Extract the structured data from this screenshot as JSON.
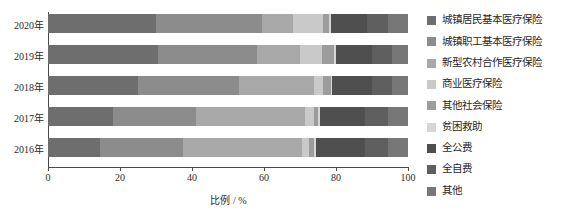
{
  "chart_data": {
    "type": "bar",
    "orientation": "horizontal",
    "stacked": true,
    "title": "",
    "xlabel": "比例 / %",
    "ylabel": "",
    "xlim": [
      0,
      100
    ],
    "xticks": [
      0,
      20,
      40,
      60,
      80,
      100
    ],
    "xtick_labels": [
      "0",
      "20",
      "40",
      "60",
      "80",
      "100"
    ],
    "grid": false,
    "legend_position": "right",
    "categories": [
      "2020年",
      "2019年",
      "2018年",
      "2017年",
      "2016年"
    ],
    "series": [
      {
        "name": "城镇居民基本医疗保险",
        "color": "#6e6e6e",
        "values": [
          30.0,
          30.5,
          25.0,
          18.0,
          14.5
        ]
      },
      {
        "name": "城镇职工基本医疗保险",
        "color": "#8c8c8c",
        "values": [
          29.5,
          27.5,
          28.0,
          23.0,
          23.0
        ]
      },
      {
        "name": "新型农村合作医疗保险",
        "color": "#a8a8a8",
        "values": [
          8.5,
          12.0,
          21.0,
          30.5,
          33.0
        ]
      },
      {
        "name": "商业医疗保险",
        "color": "#c9c9c9",
        "values": [
          8.5,
          6.0,
          2.5,
          2.5,
          2.0
        ]
      },
      {
        "name": "其他社会保险",
        "color": "#9c9c9c",
        "values": [
          1.5,
          3.5,
          2.0,
          1.0,
          1.5
        ]
      },
      {
        "name": "贫困救助",
        "color": "#d6d6d6",
        "values": [
          0.5,
          0.5,
          0.5,
          0.5,
          0.5
        ]
      },
      {
        "name": "全公费",
        "color": "#4f4f4f",
        "values": [
          10.0,
          10.0,
          11.0,
          12.5,
          13.5
        ]
      },
      {
        "name": "全自费",
        "color": "#5f5f5f",
        "values": [
          6.0,
          5.5,
          5.5,
          6.5,
          6.5
        ]
      },
      {
        "name": "其他",
        "color": "#777777",
        "values": [
          5.5,
          4.5,
          4.5,
          5.5,
          5.5
        ]
      }
    ]
  },
  "legend": {
    "items": [
      {
        "label": "城镇居民基本医疗保险",
        "color": "#6e6e6e"
      },
      {
        "label": "城镇职工基本医疗保险",
        "color": "#8c8c8c"
      },
      {
        "label": "新型农村合作医疗保险",
        "color": "#a8a8a8"
      },
      {
        "label": "商业医疗保险",
        "color": "#c9c9c9"
      },
      {
        "label": "其他社会保险",
        "color": "#9c9c9c"
      },
      {
        "label": "贫困救助",
        "color": "#d6d6d6"
      },
      {
        "label": "全公费",
        "color": "#4f4f4f"
      },
      {
        "label": "全自费",
        "color": "#5f5f5f"
      },
      {
        "label": "其他",
        "color": "#777777"
      }
    ]
  },
  "axis": {
    "x_title": "比例 / %",
    "tick_labels": [
      "0",
      "20",
      "40",
      "60",
      "80",
      "100"
    ],
    "year_labels": [
      "2020年",
      "2019年",
      "2018年",
      "2017年",
      "2016年"
    ]
  },
  "colors": {
    "axis": "#4a4a4a",
    "text": "#2b2b2b",
    "background": "#ffffff"
  }
}
